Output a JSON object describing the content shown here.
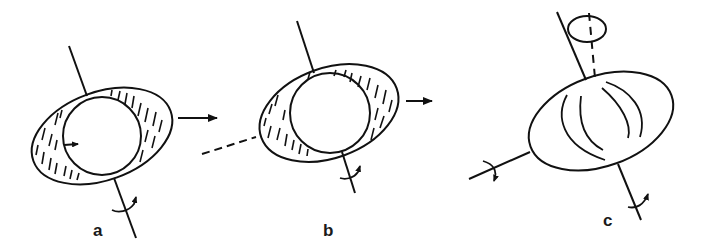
{
  "figure": {
    "panels": [
      {
        "id": "a",
        "label": "a",
        "description": "Oblate ellipsoid with inscribed sphere, hatched region, rotation axis and translation arrow"
      },
      {
        "id": "b",
        "label": "b",
        "description": "Oblate ellipsoid with offset inscribed sphere, hatched region, dashed axis and translation arrow"
      },
      {
        "id": "c",
        "label": "c",
        "description": "Ellipsoid with meridian curves, tilted axis with precession circle, two rotation axes"
      }
    ],
    "colors": {
      "stroke": "#111111",
      "background": "#ffffff"
    }
  }
}
